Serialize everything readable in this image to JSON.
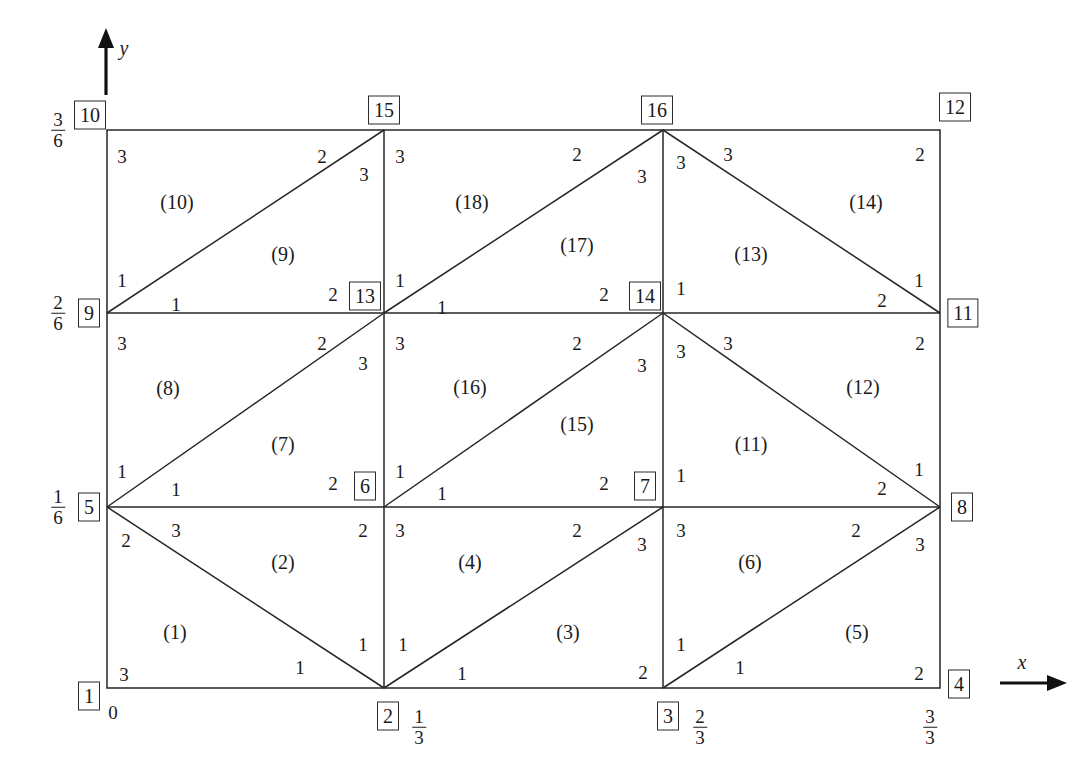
{
  "figure": {
    "type": "finite-element-mesh-diagram",
    "axes": {
      "x_label": "x",
      "y_label": "y",
      "x_ticks": [
        {
          "text": "0",
          "fraction": false
        },
        {
          "num": "1",
          "den": "3",
          "fraction": true
        },
        {
          "num": "2",
          "den": "3",
          "fraction": true
        },
        {
          "num": "3",
          "den": "3",
          "fraction": true
        }
      ],
      "y_ticks": [
        {
          "num": "1",
          "den": "6",
          "fraction": true
        },
        {
          "num": "2",
          "den": "6",
          "fraction": true
        },
        {
          "num": "3",
          "den": "6",
          "fraction": true
        }
      ]
    },
    "global_nodes": [
      {
        "id": "1",
        "x": 0.0,
        "y": 0.0
      },
      {
        "id": "2",
        "x": 0.333333,
        "y": 0.0
      },
      {
        "id": "3",
        "x": 0.666667,
        "y": 0.0
      },
      {
        "id": "4",
        "x": 1.0,
        "y": 0.0
      },
      {
        "id": "5",
        "x": 0.0,
        "y": 0.166667
      },
      {
        "id": "6",
        "x": 0.333333,
        "y": 0.166667
      },
      {
        "id": "7",
        "x": 0.666667,
        "y": 0.166667
      },
      {
        "id": "8",
        "x": 1.0,
        "y": 0.166667
      },
      {
        "id": "9",
        "x": 0.0,
        "y": 0.333333
      },
      {
        "id": "10",
        "x": 0.0,
        "y": 0.5
      },
      {
        "id": "11",
        "x": 1.0,
        "y": 0.333333
      },
      {
        "id": "12",
        "x": 1.0,
        "y": 0.5
      },
      {
        "id": "13",
        "x": 0.333333,
        "y": 0.333333
      },
      {
        "id": "14",
        "x": 0.666667,
        "y": 0.333333
      },
      {
        "id": "15",
        "x": 0.333333,
        "y": 0.5
      },
      {
        "id": "16",
        "x": 0.666667,
        "y": 0.5
      }
    ],
    "elements": [
      {
        "id": "(1)",
        "cx": 175,
        "cy": 632
      },
      {
        "id": "(2)",
        "cx": 283,
        "cy": 562
      },
      {
        "id": "(3)",
        "cx": 568,
        "cy": 632
      },
      {
        "id": "(4)",
        "cx": 470,
        "cy": 562
      },
      {
        "id": "(5)",
        "cx": 857,
        "cy": 632
      },
      {
        "id": "(6)",
        "cx": 750,
        "cy": 562
      },
      {
        "id": "(7)",
        "cx": 283,
        "cy": 444
      },
      {
        "id": "(8)",
        "cx": 168,
        "cy": 388
      },
      {
        "id": "(9)",
        "cx": 283,
        "cy": 254
      },
      {
        "id": "(10)",
        "cx": 177,
        "cy": 202
      },
      {
        "id": "(11)",
        "cx": 751,
        "cy": 444
      },
      {
        "id": "(12)",
        "cx": 863,
        "cy": 387
      },
      {
        "id": "(13)",
        "cx": 751,
        "cy": 254
      },
      {
        "id": "(14)",
        "cx": 866,
        "cy": 202
      },
      {
        "id": "(15)",
        "cx": 577,
        "cy": 424
      },
      {
        "id": "(16)",
        "cx": 470,
        "cy": 387
      },
      {
        "id": "(17)",
        "cx": 577,
        "cy": 245
      },
      {
        "id": "(18)",
        "cx": 472,
        "cy": 202
      }
    ],
    "local_node_numbers": [
      {
        "v": "3",
        "x": 122,
        "y": 157
      },
      {
        "v": "2",
        "x": 322,
        "y": 157
      },
      {
        "v": "3",
        "x": 364,
        "y": 175
      },
      {
        "v": "3",
        "x": 400,
        "y": 157
      },
      {
        "v": "2",
        "x": 577,
        "y": 155
      },
      {
        "v": "3",
        "x": 642,
        "y": 177
      },
      {
        "v": "3",
        "x": 681,
        "y": 163
      },
      {
        "v": "3",
        "x": 728,
        "y": 155
      },
      {
        "v": "2",
        "x": 920,
        "y": 155
      },
      {
        "v": "1",
        "x": 122,
        "y": 281
      },
      {
        "v": "1",
        "x": 176,
        "y": 305
      },
      {
        "v": "2",
        "x": 333,
        "y": 295
      },
      {
        "v": "1",
        "x": 400,
        "y": 281
      },
      {
        "v": "1",
        "x": 442,
        "y": 308
      },
      {
        "v": "2",
        "x": 604,
        "y": 295
      },
      {
        "v": "1",
        "x": 681,
        "y": 289
      },
      {
        "v": "2",
        "x": 882,
        "y": 301
      },
      {
        "v": "1",
        "x": 919,
        "y": 281
      },
      {
        "v": "3",
        "x": 122,
        "y": 344
      },
      {
        "v": "2",
        "x": 322,
        "y": 344
      },
      {
        "v": "3",
        "x": 363,
        "y": 364
      },
      {
        "v": "3",
        "x": 400,
        "y": 344
      },
      {
        "v": "2",
        "x": 577,
        "y": 344
      },
      {
        "v": "3",
        "x": 642,
        "y": 366
      },
      {
        "v": "3",
        "x": 681,
        "y": 352
      },
      {
        "v": "3",
        "x": 728,
        "y": 344
      },
      {
        "v": "2",
        "x": 920,
        "y": 344
      },
      {
        "v": "1",
        "x": 122,
        "y": 472
      },
      {
        "v": "1",
        "x": 176,
        "y": 490
      },
      {
        "v": "2",
        "x": 333,
        "y": 484
      },
      {
        "v": "1",
        "x": 400,
        "y": 472
      },
      {
        "v": "1",
        "x": 442,
        "y": 494
      },
      {
        "v": "2",
        "x": 604,
        "y": 484
      },
      {
        "v": "1",
        "x": 681,
        "y": 476
      },
      {
        "v": "2",
        "x": 882,
        "y": 489
      },
      {
        "v": "1",
        "x": 919,
        "y": 470
      },
      {
        "v": "2",
        "x": 126,
        "y": 541
      },
      {
        "v": "3",
        "x": 176,
        "y": 531
      },
      {
        "v": "2",
        "x": 363,
        "y": 531
      },
      {
        "v": "3",
        "x": 400,
        "y": 531
      },
      {
        "v": "2",
        "x": 577,
        "y": 531
      },
      {
        "v": "3",
        "x": 642,
        "y": 545
      },
      {
        "v": "3",
        "x": 681,
        "y": 531
      },
      {
        "v": "2",
        "x": 856,
        "y": 531
      },
      {
        "v": "3",
        "x": 920,
        "y": 545
      },
      {
        "v": "1",
        "x": 363,
        "y": 645
      },
      {
        "v": "1",
        "x": 403,
        "y": 645
      },
      {
        "v": "1",
        "x": 681,
        "y": 645
      },
      {
        "v": "3",
        "x": 124,
        "y": 675
      },
      {
        "v": "1",
        "x": 300,
        "y": 668
      },
      {
        "v": "1",
        "x": 462,
        "y": 674
      },
      {
        "v": "2",
        "x": 643,
        "y": 673
      },
      {
        "v": "1",
        "x": 740,
        "y": 668
      },
      {
        "v": "2",
        "x": 919,
        "y": 674
      }
    ]
  }
}
